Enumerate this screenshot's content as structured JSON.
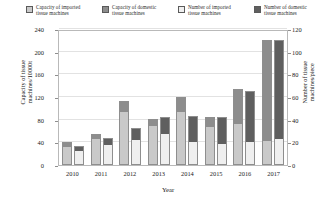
{
  "chart_data": {
    "type": "bar",
    "title": "",
    "xlabel": "Year",
    "ylabel": "Capacity of tissue machines/10000t",
    "ylabel_right": "Number of tissue machines/piece",
    "categories": [
      "2010",
      "2011",
      "2012",
      "2013",
      "2014",
      "2015",
      "2016",
      "2017"
    ],
    "ylim": [
      0,
      240
    ],
    "ylim_right": [
      0,
      120
    ],
    "yticks": [
      0,
      40,
      80,
      120,
      160,
      200,
      240
    ],
    "yticks_right": [
      0,
      20,
      40,
      60,
      80,
      100,
      120
    ],
    "grid": true,
    "legend_position": "top",
    "stacked": true,
    "series": [
      {
        "name": "Capacity of imported tissue machines",
        "axis": "left",
        "group": "capacity",
        "color": "#c9c9c9",
        "values": [
          33,
          47,
          95,
          70,
          95,
          68,
          72,
          42
        ]
      },
      {
        "name": "Capacity of domestic tissue machines",
        "axis": "left",
        "group": "capacity",
        "color": "#8d8d8d",
        "values": [
          7,
          8,
          18,
          12,
          25,
          17,
          62,
          178
        ]
      },
      {
        "name": "Number of imported tissue machines",
        "axis": "right",
        "group": "number",
        "color": "#efefef",
        "values": [
          13,
          18,
          22,
          28,
          20,
          18,
          20,
          22
        ]
      },
      {
        "name": "Number of domestic tissue machines",
        "axis": "right",
        "group": "number",
        "color": "#5f5f5f",
        "values": [
          4,
          6,
          11,
          14,
          23,
          24,
          45,
          88
        ]
      }
    ]
  },
  "legend": {
    "items": [
      {
        "label": "Capacity of imported\ntissue machines",
        "color": "#c9c9c9"
      },
      {
        "label": "Capacity of domestic\ntissue machines",
        "color": "#8d8d8d"
      },
      {
        "label": "Number of imported\ntissue machines",
        "color": "#efefef"
      },
      {
        "label": "Number of domestic\ntissue machines",
        "color": "#5f5f5f"
      }
    ]
  },
  "axes": {
    "left_title": "Capacity of tissue\nmachines/10000t",
    "right_title": "Number of tissue\nmachines/piece",
    "x_title": "Year"
  }
}
